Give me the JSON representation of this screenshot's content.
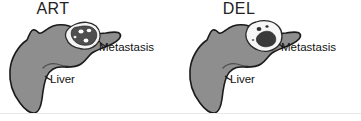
{
  "figure": {
    "type": "anatomical-diagram",
    "colors": {
      "liver_fill": "#8e8e8e",
      "liver_outline": "#1a1a1a",
      "lesion_rim": "#f2f2f2",
      "lesion_core_art": "#4f4f4f",
      "lesion_core_del": "#3a3a3a",
      "speckle": "#ffffff",
      "background": "#ffffff",
      "baseline": "#e8e8e8"
    }
  },
  "panels": [
    {
      "id": "art",
      "title": "ART",
      "labels": {
        "metastasis": "Metastasis",
        "liver": "Liver"
      }
    },
    {
      "id": "del",
      "title": "DEL",
      "labels": {
        "metastasis": "Metastasis",
        "liver": "Liver"
      }
    }
  ]
}
